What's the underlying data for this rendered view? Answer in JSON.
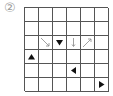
{
  "label": "②",
  "grid": {
    "rows": 6,
    "cols": 6
  },
  "symbols": [
    {
      "row": 2,
      "col": 1,
      "type": "arrow-down-right",
      "color": "#888888"
    },
    {
      "row": 2,
      "col": 2,
      "type": "triangle-down",
      "color": "#111111"
    },
    {
      "row": 2,
      "col": 3,
      "type": "arrow-down",
      "color": "#888888"
    },
    {
      "row": 2,
      "col": 4,
      "type": "arrow-up-right",
      "color": "#888888"
    },
    {
      "row": 3,
      "col": 0,
      "type": "triangle-up",
      "color": "#111111"
    },
    {
      "row": 4,
      "col": 3,
      "type": "triangle-left",
      "color": "#111111"
    },
    {
      "row": 5,
      "col": 5,
      "type": "triangle-right",
      "color": "#111111"
    }
  ]
}
